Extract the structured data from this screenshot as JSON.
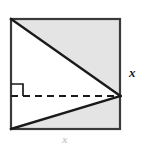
{
  "figure": {
    "canvas": {
      "width": 145,
      "height": 144,
      "background": "#ffffff"
    },
    "colors": {
      "stroke": "#1a1a1a",
      "square_border": "#3a3a3a",
      "shading": "#e4e4e4",
      "white_region": "#ffffff",
      "dashed_line": "#1a1a1a",
      "faint_label": "#c9c9c9"
    },
    "square": {
      "name": "outer-square",
      "left": 11,
      "top": 19,
      "right": 120,
      "bottom": 129,
      "side_length_px": 109,
      "border_width_px": 2,
      "fill": "#e4e4e4"
    },
    "triangle": {
      "name": "inscribed-triangle",
      "fill": "#ffffff",
      "vertices": [
        {
          "name": "top-left-corner",
          "x": 11,
          "y": 19
        },
        {
          "name": "right-edge-apex",
          "x": 120,
          "y": 96
        },
        {
          "name": "bottom-left-corner",
          "x": 11,
          "y": 129
        }
      ]
    },
    "segments": [
      {
        "name": "upper-diagonal",
        "from": [
          11,
          19
        ],
        "to": [
          120,
          96
        ],
        "style": "solid",
        "width": 2.4
      },
      {
        "name": "lower-diagonal",
        "from": [
          11,
          129
        ],
        "to": [
          120,
          96
        ],
        "style": "solid",
        "width": 2.4
      },
      {
        "name": "altitude-dashed",
        "from": [
          11,
          96
        ],
        "to": [
          120,
          96
        ],
        "style": "dashed",
        "width": 2,
        "dash_pattern": "7,5"
      }
    ],
    "right_angle_marker": {
      "name": "right-angle-marker",
      "x": 11,
      "y": 84,
      "size": 12,
      "width": 1.6
    },
    "labels": {
      "right_side": {
        "text": "x",
        "meaning": "side-length-x",
        "italic": true
      },
      "bottom_side": {
        "text": "x",
        "meaning": "side-length-x-clipped",
        "italic": true,
        "clipped": true
      }
    }
  }
}
